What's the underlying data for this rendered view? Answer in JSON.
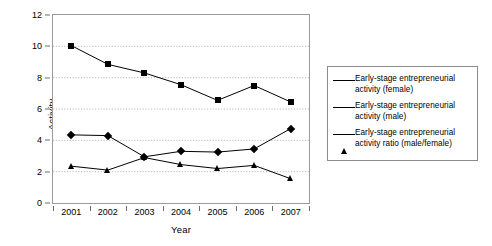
{
  "chart_data": {
    "type": "line",
    "title": "",
    "xlabel": "Year",
    "ylabel": "Activity",
    "categories": [
      "2001",
      "2002",
      "2003",
      "2004",
      "2005",
      "2006",
      "2007"
    ],
    "x": [
      2001,
      2002,
      2003,
      2004,
      2005,
      2006,
      2007
    ],
    "ylim": [
      0,
      12
    ],
    "y_ticks": [
      0,
      2,
      4,
      6,
      8,
      10,
      12
    ],
    "grid": "horizontal-dotted",
    "legend_position": "right-outside",
    "series": [
      {
        "name": "Early-stage entrepreneurial activity (female)",
        "marker": "diamond",
        "color": "#000000",
        "values": [
          4.35,
          4.3,
          2.95,
          3.3,
          3.25,
          3.45,
          4.75
        ]
      },
      {
        "name": "Early-stage entrepreneurial activity (male)",
        "marker": "square",
        "color": "#000000",
        "values": [
          10.05,
          8.85,
          8.3,
          7.55,
          6.55,
          7.5,
          6.45
        ]
      },
      {
        "name": "Early-stage entrepreneurial activity ratio (male/female)",
        "marker": "triangle",
        "color": "#000000",
        "values": [
          2.35,
          2.1,
          2.9,
          2.45,
          2.2,
          2.4,
          1.55
        ]
      }
    ]
  },
  "legend": {
    "items": [
      {
        "marker": "diamond",
        "label": "Early-stage entrepreneurial activity (female)"
      },
      {
        "marker": "square",
        "label": "Early-stage entrepreneurial activity (male)"
      },
      {
        "marker": "triangle",
        "label": "Early-stage entrepreneurial activity ratio (male/female)"
      }
    ]
  },
  "axes": {
    "y_title": "Activity",
    "x_title": "Year"
  }
}
